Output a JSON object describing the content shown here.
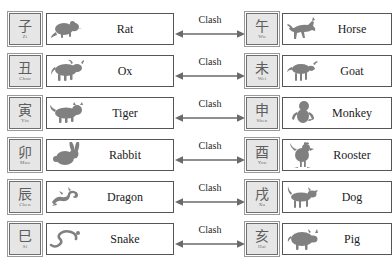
{
  "diagram": {
    "relation_label": "Clash",
    "colors": {
      "branch_fill": "#e6e6e6",
      "branch_border": "#6f6f6f",
      "animal_border": "#555555",
      "icon": "#808080",
      "text": "#1a1a1a",
      "background": "#ffffff"
    },
    "rows": [
      {
        "left": {
          "branch_char": "子",
          "branch_pinyin": "Zi",
          "animal": "Rat",
          "icon": "rat-icon"
        },
        "relation": "Clash",
        "right": {
          "branch_char": "午",
          "branch_pinyin": "Wu",
          "animal": "Horse",
          "icon": "horse-icon"
        }
      },
      {
        "left": {
          "branch_char": "丑",
          "branch_pinyin": "Chou",
          "animal": "Ox",
          "icon": "ox-icon"
        },
        "relation": "Clash",
        "right": {
          "branch_char": "未",
          "branch_pinyin": "Wei",
          "animal": "Goat",
          "icon": "goat-icon"
        }
      },
      {
        "left": {
          "branch_char": "寅",
          "branch_pinyin": "Yin",
          "animal": "Tiger",
          "icon": "tiger-icon"
        },
        "relation": "Clash",
        "right": {
          "branch_char": "申",
          "branch_pinyin": "Shen",
          "animal": "Monkey",
          "icon": "monkey-icon"
        }
      },
      {
        "left": {
          "branch_char": "卯",
          "branch_pinyin": "Mao",
          "animal": "Rabbit",
          "icon": "rabbit-icon"
        },
        "relation": "Clash",
        "right": {
          "branch_char": "酉",
          "branch_pinyin": "You",
          "animal": "Rooster",
          "icon": "rooster-icon"
        }
      },
      {
        "left": {
          "branch_char": "辰",
          "branch_pinyin": "Chen",
          "animal": "Dragon",
          "icon": "dragon-icon"
        },
        "relation": "Clash",
        "right": {
          "branch_char": "戌",
          "branch_pinyin": "Xu",
          "animal": "Dog",
          "icon": "dog-icon"
        }
      },
      {
        "left": {
          "branch_char": "巳",
          "branch_pinyin": "Si",
          "animal": "Snake",
          "icon": "snake-icon"
        },
        "relation": "Clash",
        "right": {
          "branch_char": "亥",
          "branch_pinyin": "Hai",
          "animal": "Pig",
          "icon": "pig-icon"
        }
      }
    ]
  }
}
